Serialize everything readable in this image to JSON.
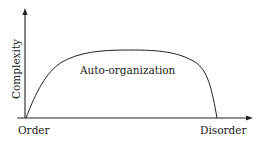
{
  "diagram": {
    "y_axis_label": "Complexity",
    "x_axis_start_label": "Order",
    "x_axis_end_label": "Disorder",
    "curve_label": "Auto-organization",
    "line_color": "#222222"
  }
}
